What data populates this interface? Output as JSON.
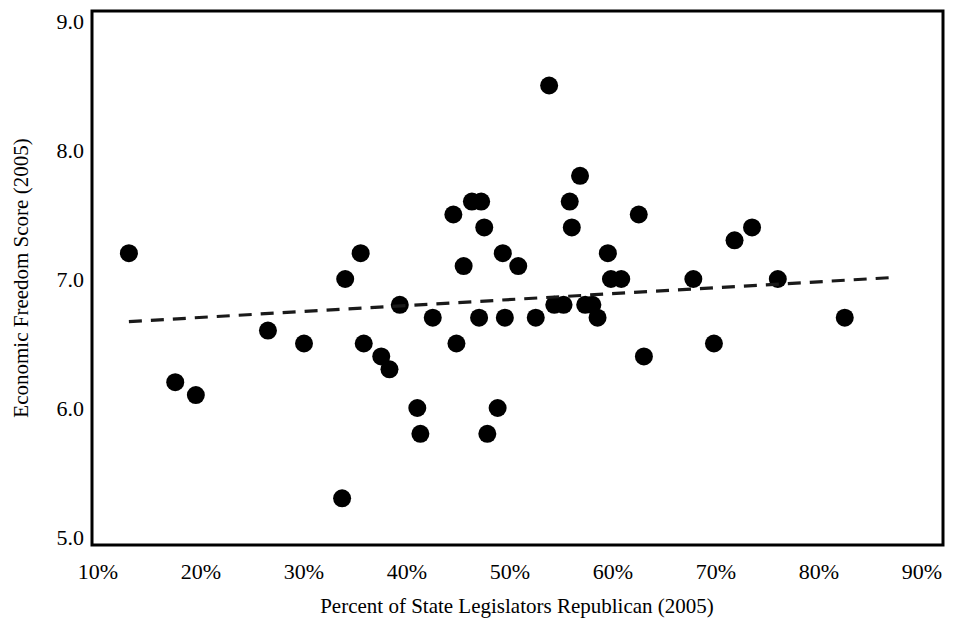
{
  "figure": {
    "name": "economic-freedom-scatter",
    "background_color": "#ffffff",
    "ink_color": "#000000"
  },
  "chart_data": {
    "type": "scatter",
    "title": "",
    "xlabel": "Percent of State Legislators Republican (2005)",
    "ylabel": "Economic Freedom Score (2005)",
    "xlim": [
      10,
      90
    ],
    "ylim": [
      5.0,
      9.0
    ],
    "xticks": [
      10,
      20,
      30,
      40,
      50,
      60,
      70,
      80,
      90
    ],
    "xtick_labels": [
      "10%",
      "20%",
      "30%",
      "40%",
      "50%",
      "60%",
      "70%",
      "80%",
      "90%"
    ],
    "yticks": [
      5.0,
      6.0,
      7.0,
      8.0,
      9.0
    ],
    "ytick_labels": [
      "5.0",
      "6.0",
      "7.0",
      "8.0",
      "9.0"
    ],
    "grid": false,
    "legend": null,
    "marker": "filled-circle",
    "marker_color": "#000000",
    "marker_radius_px": 9,
    "points": [
      {
        "x": 13.0,
        "y": 7.2
      },
      {
        "x": 17.5,
        "y": 6.2
      },
      {
        "x": 19.5,
        "y": 6.1
      },
      {
        "x": 26.5,
        "y": 6.6
      },
      {
        "x": 30.0,
        "y": 6.5
      },
      {
        "x": 33.7,
        "y": 5.3
      },
      {
        "x": 34.0,
        "y": 7.0
      },
      {
        "x": 35.5,
        "y": 7.2
      },
      {
        "x": 35.8,
        "y": 6.5
      },
      {
        "x": 37.5,
        "y": 6.4
      },
      {
        "x": 38.3,
        "y": 6.3
      },
      {
        "x": 39.3,
        "y": 6.8
      },
      {
        "x": 41.0,
        "y": 6.0
      },
      {
        "x": 41.3,
        "y": 5.8
      },
      {
        "x": 42.5,
        "y": 6.7
      },
      {
        "x": 44.5,
        "y": 7.5
      },
      {
        "x": 44.8,
        "y": 6.5
      },
      {
        "x": 45.5,
        "y": 7.1
      },
      {
        "x": 46.3,
        "y": 7.6
      },
      {
        "x": 47.2,
        "y": 7.6
      },
      {
        "x": 47.5,
        "y": 7.4
      },
      {
        "x": 47.0,
        "y": 6.7
      },
      {
        "x": 47.8,
        "y": 5.8
      },
      {
        "x": 48.8,
        "y": 6.0
      },
      {
        "x": 49.3,
        "y": 7.2
      },
      {
        "x": 49.5,
        "y": 6.7
      },
      {
        "x": 50.8,
        "y": 7.1
      },
      {
        "x": 52.5,
        "y": 6.7
      },
      {
        "x": 53.8,
        "y": 8.5
      },
      {
        "x": 54.3,
        "y": 6.8
      },
      {
        "x": 55.2,
        "y": 6.8
      },
      {
        "x": 55.8,
        "y": 7.6
      },
      {
        "x": 56.0,
        "y": 7.4
      },
      {
        "x": 56.8,
        "y": 7.8
      },
      {
        "x": 57.3,
        "y": 6.8
      },
      {
        "x": 58.0,
        "y": 6.8
      },
      {
        "x": 58.5,
        "y": 6.7
      },
      {
        "x": 59.5,
        "y": 7.2
      },
      {
        "x": 59.8,
        "y": 7.0
      },
      {
        "x": 60.8,
        "y": 7.0
      },
      {
        "x": 62.5,
        "y": 7.5
      },
      {
        "x": 63.0,
        "y": 6.4
      },
      {
        "x": 67.8,
        "y": 7.0
      },
      {
        "x": 69.8,
        "y": 6.5
      },
      {
        "x": 71.8,
        "y": 7.3
      },
      {
        "x": 73.5,
        "y": 7.4
      },
      {
        "x": 76.0,
        "y": 7.0
      },
      {
        "x": 82.5,
        "y": 6.7
      }
    ],
    "trend_line": {
      "style": "dashed",
      "color": "#1a1a1a",
      "x_start": 13.0,
      "y_start": 6.67,
      "x_end": 86.8,
      "y_end": 7.01
    }
  }
}
